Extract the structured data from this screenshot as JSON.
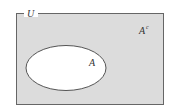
{
  "diagram": {
    "type": "venn",
    "universe_label": "U",
    "set_label": "A",
    "complement_label": "A",
    "complement_superscript": "c",
    "colors": {
      "universe_fill": "#dcdcdc",
      "set_fill": "#ffffff",
      "stroke": "#555555"
    }
  }
}
